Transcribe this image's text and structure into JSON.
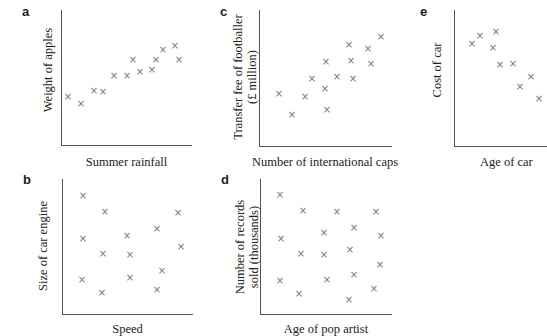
{
  "chart_data": [
    {
      "panel": "a",
      "type": "scatter",
      "xlabel": "Summer rainfall",
      "ylabel": "Weight of apples",
      "grid": false,
      "x_pixel": [
        68,
        81,
        94,
        103,
        114,
        127,
        133,
        140,
        152,
        156,
        163,
        175,
        179
      ],
      "y_pixel": [
        97,
        104,
        91,
        92,
        76,
        76,
        60,
        72,
        70,
        60,
        50,
        46,
        60
      ],
      "points": [
        [
          1,
          3
        ],
        [
          2,
          2.7
        ],
        [
          3,
          3.7
        ],
        [
          3.5,
          3.6
        ],
        [
          4.2,
          5.3
        ],
        [
          5,
          5.3
        ],
        [
          5.4,
          6.5
        ],
        [
          5.8,
          5.7
        ],
        [
          6.6,
          5.9
        ],
        [
          6.9,
          6.5
        ],
        [
          7.3,
          7.4
        ],
        [
          8.1,
          7.7
        ],
        [
          8.4,
          6.6
        ]
      ]
    },
    {
      "panel": "b",
      "type": "scatter",
      "xlabel": "Speed",
      "ylabel": "Size of car engine",
      "grid": false,
      "x_pixel": [
        83,
        105,
        178,
        157,
        127,
        83,
        103,
        130,
        181,
        162,
        82,
        102,
        130,
        157
      ],
      "y_pixel": [
        196,
        212,
        213,
        229,
        236,
        239,
        254,
        255,
        247,
        271,
        280,
        293,
        278,
        290
      ],
      "points": [
        [
          1,
          9
        ],
        [
          2.2,
          7.9
        ],
        [
          7.2,
          7.8
        ],
        [
          5.8,
          6.9
        ],
        [
          4,
          6.4
        ],
        [
          1,
          6.2
        ],
        [
          2,
          5.2
        ],
        [
          4.2,
          5.1
        ],
        [
          7.4,
          5.6
        ],
        [
          6.2,
          4
        ],
        [
          1,
          3.5
        ],
        [
          2,
          2.6
        ],
        [
          4.2,
          3.5
        ],
        [
          5.8,
          2.8
        ]
      ]
    },
    {
      "panel": "c",
      "type": "scatter",
      "xlabel": "Number of international caps",
      "ylabel": "Transfer fee of footballer (£ million)",
      "grid": false,
      "x_pixel": [
        279,
        292,
        305,
        312,
        325,
        326,
        327,
        337,
        349,
        351,
        353,
        368,
        371,
        381
      ],
      "y_pixel": [
        94,
        115,
        97,
        79,
        89,
        62,
        110,
        77,
        45,
        61,
        79,
        49,
        64,
        37
      ],
      "points": [
        [
          1,
          3.7
        ],
        [
          2,
          2.2
        ],
        [
          3,
          3.5
        ],
        [
          3.5,
          4.9
        ],
        [
          4.5,
          4.2
        ],
        [
          4.6,
          6.3
        ],
        [
          4.7,
          2.6
        ],
        [
          5.4,
          5
        ],
        [
          6.3,
          7.4
        ],
        [
          6.5,
          6.2
        ],
        [
          6.6,
          4.8
        ],
        [
          7.7,
          7.1
        ],
        [
          7.9,
          6
        ],
        [
          8.7,
          8
        ]
      ]
    },
    {
      "panel": "d",
      "type": "scatter",
      "xlabel": "Age of pop artist",
      "ylabel": "Number of records sold (thousands)",
      "grid": false,
      "x_pixel": [
        280,
        303,
        337,
        376,
        281,
        301,
        324,
        354,
        381,
        324,
        350,
        380,
        280,
        299,
        327,
        354,
        374,
        349
      ],
      "y_pixel": [
        195,
        211,
        212,
        212,
        239,
        254,
        233,
        228,
        236,
        255,
        250,
        265,
        281,
        294,
        280,
        275,
        289,
        300
      ],
      "points": [
        [
          1,
          9
        ],
        [
          2,
          7.8
        ],
        [
          3.6,
          7.8
        ],
        [
          5.4,
          7.8
        ],
        [
          1,
          6
        ],
        [
          2,
          5
        ],
        [
          3,
          6.4
        ],
        [
          4.4,
          6.8
        ],
        [
          5.6,
          6.2
        ],
        [
          3,
          4.9
        ],
        [
          4.3,
          5.3
        ],
        [
          5.6,
          4.3
        ],
        [
          1,
          3.4
        ],
        [
          2,
          2.6
        ],
        [
          3.2,
          3.5
        ],
        [
          4.4,
          3.8
        ],
        [
          5.4,
          2.9
        ],
        [
          4.2,
          2.1
        ]
      ]
    },
    {
      "panel": "e",
      "type": "scatter",
      "xlabel": "Age of car",
      "ylabel": "Cost of car",
      "grid": false,
      "x_pixel": [
        472,
        480,
        496,
        493,
        500,
        513,
        520,
        531,
        539
      ],
      "y_pixel": [
        44,
        36,
        32,
        48,
        65,
        64,
        87,
        77,
        99
      ],
      "points": [
        [
          1,
          7.4
        ],
        [
          1.5,
          7.9
        ],
        [
          2.5,
          8.1
        ],
        [
          2.3,
          7.2
        ],
        [
          2.8,
          6.1
        ],
        [
          3.5,
          6.2
        ],
        [
          4,
          4.8
        ],
        [
          4.7,
          5.4
        ],
        [
          5.2,
          4.1
        ]
      ]
    }
  ],
  "panels": {
    "a": {
      "letter": "a",
      "xlabel": "Summer rainfall",
      "ylabel": "Weight of apples"
    },
    "b": {
      "letter": "b",
      "xlabel": "Speed",
      "ylabel": "Size of car engine"
    },
    "c": {
      "letter": "c",
      "xlabel": "Number of international caps",
      "ylabel_line1": "Transfer fee of footballer",
      "ylabel_line2": "(£ million)"
    },
    "d": {
      "letter": "d",
      "xlabel": "Age of pop artist",
      "ylabel_line1": "Number of records",
      "ylabel_line2": "sold (thousands)"
    },
    "e": {
      "letter": "e",
      "xlabel": "Age of car",
      "ylabel": "Cost of car"
    }
  },
  "marker": {
    "glyph": "×",
    "color": "#777777"
  },
  "axis_color": "#555555"
}
